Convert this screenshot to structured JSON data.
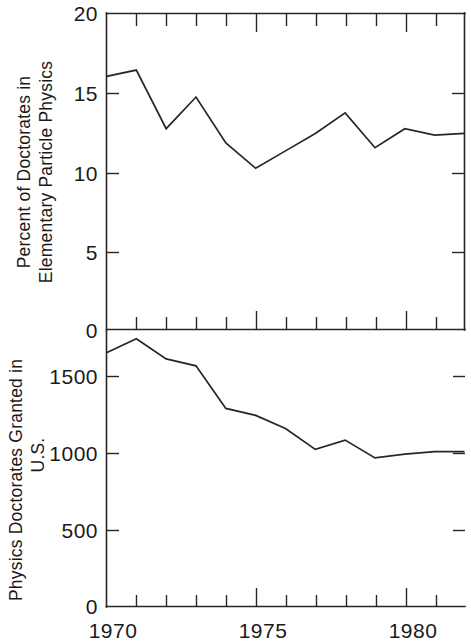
{
  "figure": {
    "background_color": "#ffffff",
    "line_color": "#262626",
    "text_color": "#1a1a1a"
  },
  "x_axis": {
    "label_1970": "1970",
    "label_1975": "1975",
    "label_1980": "1980",
    "tick_values": [
      1970,
      1971,
      1972,
      1973,
      1974,
      1975,
      1976,
      1977,
      1978,
      1979,
      1980,
      1981,
      1982
    ],
    "major_ticks": [
      1970,
      1975,
      1980
    ],
    "range": [
      1970,
      1982
    ]
  },
  "top_panel": {
    "y_title_line1": "Percent of Doctorates in",
    "y_title_line2": "Elementary Particle Physics",
    "y_tick_labels": [
      "20",
      "15",
      "10",
      "5",
      "0"
    ],
    "y_tick_values": [
      20,
      15,
      10,
      5,
      0
    ]
  },
  "bottom_panel": {
    "y_title_line1": "Physics Doctorates Granted in",
    "y_title_line2": "U.S.",
    "y_tick_labels": [
      "1500",
      "1000",
      "500",
      "0"
    ],
    "y_tick_values": [
      1500,
      1000,
      500,
      0
    ]
  },
  "chart_data": [
    {
      "type": "line",
      "panel": "top",
      "title": "",
      "xlabel": "",
      "ylabel": "Percent of Doctorates in Elementary Particle Physics",
      "x": [
        1970,
        1971,
        1972,
        1973,
        1974,
        1975,
        1976,
        1977,
        1978,
        1979,
        1980,
        1981,
        1982
      ],
      "values": [
        16.0,
        16.4,
        12.7,
        14.7,
        11.8,
        10.2,
        11.3,
        12.4,
        13.7,
        11.5,
        12.7,
        12.3,
        12.4
      ],
      "xlim": [
        1970,
        1982
      ],
      "ylim": [
        0,
        20
      ],
      "ytick_interval": 5,
      "grid": false,
      "legend": false
    },
    {
      "type": "line",
      "panel": "bottom",
      "title": "",
      "xlabel": "",
      "ylabel": "Physics Doctorates Granted in U.S.",
      "x": [
        1970,
        1971,
        1972,
        1973,
        1974,
        1975,
        1976,
        1977,
        1978,
        1979,
        1980,
        1981,
        1982
      ],
      "values": [
        1640,
        1730,
        1600,
        1555,
        1280,
        1235,
        1150,
        1015,
        1075,
        960,
        985,
        1000,
        1000
      ],
      "xlim": [
        1970,
        1982
      ],
      "ylim": [
        0,
        1780
      ],
      "ytick_interval": 500,
      "grid": false,
      "legend": false
    }
  ]
}
